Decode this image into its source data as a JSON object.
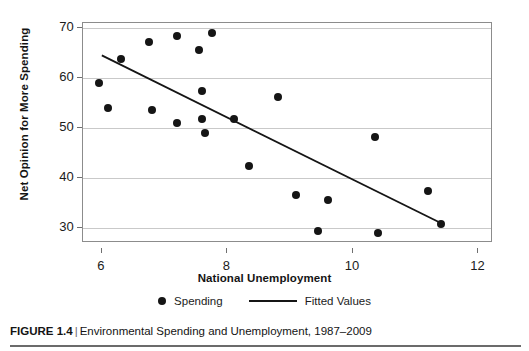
{
  "figure": {
    "caption_label": "FIGURE 1.4",
    "caption_separator": "|",
    "caption_text": "Environmental Spending and Unemployment, 1987–2009"
  },
  "legend": {
    "position": "below-axis",
    "entries": [
      {
        "label": "Spending",
        "marker": "dot",
        "color": "#151515"
      },
      {
        "label": "Fitted Values",
        "marker": "line",
        "color": "#151515"
      }
    ]
  },
  "chart_data": {
    "type": "scatter",
    "title": "",
    "subtitle": "",
    "xlabel": "National Unemployment",
    "ylabel": "Net Opinion for More Spending",
    "xlim": [
      5.7,
      12.2
    ],
    "ylim": [
      27.3,
      71.0
    ],
    "xticks": [
      6,
      8,
      10,
      12
    ],
    "xticklabels": [
      "6",
      "8",
      "10",
      "12"
    ],
    "yticks": [
      30,
      40,
      50,
      60,
      70
    ],
    "yticklabels": [
      "30",
      "40",
      "50",
      "60",
      "70"
    ],
    "grid": "horizontal",
    "legend_position": "bottom",
    "series": [
      {
        "name": "Spending",
        "type": "scatter",
        "marker": "dot",
        "color": "#151515",
        "points": [
          {
            "x": 5.95,
            "y": 59.0
          },
          {
            "x": 6.1,
            "y": 54.0
          },
          {
            "x": 6.3,
            "y": 63.8
          },
          {
            "x": 6.75,
            "y": 67.2
          },
          {
            "x": 6.8,
            "y": 53.5
          },
          {
            "x": 7.2,
            "y": 68.5
          },
          {
            "x": 7.2,
            "y": 51.0
          },
          {
            "x": 7.55,
            "y": 65.6
          },
          {
            "x": 7.6,
            "y": 57.3
          },
          {
            "x": 7.6,
            "y": 51.8
          },
          {
            "x": 7.65,
            "y": 48.9
          },
          {
            "x": 7.75,
            "y": 69.1
          },
          {
            "x": 8.1,
            "y": 51.7
          },
          {
            "x": 8.35,
            "y": 42.4
          },
          {
            "x": 8.8,
            "y": 56.1
          },
          {
            "x": 9.1,
            "y": 36.5
          },
          {
            "x": 9.45,
            "y": 29.3
          },
          {
            "x": 9.6,
            "y": 35.5
          },
          {
            "x": 10.35,
            "y": 48.2
          },
          {
            "x": 10.4,
            "y": 28.9
          },
          {
            "x": 11.2,
            "y": 37.4
          },
          {
            "x": 11.4,
            "y": 30.8
          }
        ]
      },
      {
        "name": "Fitted Values",
        "type": "line",
        "color": "#151515",
        "points": [
          {
            "x": 6.0,
            "y": 64.5
          },
          {
            "x": 11.4,
            "y": 30.9
          }
        ]
      }
    ]
  }
}
